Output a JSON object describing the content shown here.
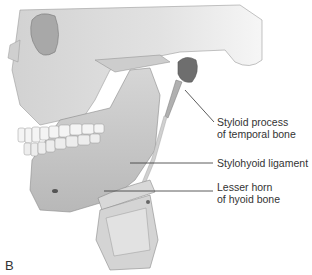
{
  "figure": {
    "panel_letter": "B",
    "labels": [
      {
        "id": "styloid",
        "line1": "Styloid process",
        "line2": "of temporal bone"
      },
      {
        "id": "stylohyoid",
        "line1": "Stylohyoid ligament"
      },
      {
        "id": "lesser_horn",
        "line1": "Lesser horn",
        "line2": "of hyoid bone"
      }
    ],
    "colors": {
      "bone_light": "#e6e6e6",
      "bone_mid": "#c4c4c4",
      "bone_dark": "#8a8a8a",
      "line": "#333333",
      "text": "#333333"
    }
  }
}
